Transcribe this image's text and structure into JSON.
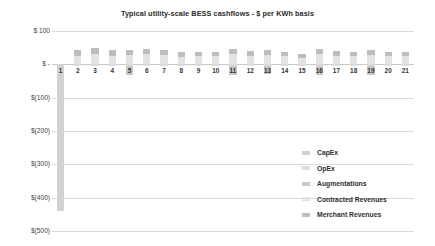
{
  "chart_data": {
    "type": "bar",
    "title": "Typical utility-scale BESS cashflows - $ per KWh basis",
    "xlabel": "",
    "ylabel": "",
    "stacked": true,
    "grid": true,
    "legend_position": "right",
    "ylim": [
      -500,
      100
    ],
    "yticks": [
      100,
      0,
      -100,
      -200,
      -300,
      -400,
      -500
    ],
    "ytick_labels": [
      "$ 100",
      "$ -",
      "$(100)",
      "$(200)",
      "$(300)",
      "$(400)",
      "$(500)"
    ],
    "categories": [
      "1",
      "2",
      "3",
      "4",
      "5",
      "6",
      "7",
      "8",
      "9",
      "10",
      "11",
      "12",
      "13",
      "14",
      "15",
      "16",
      "17",
      "18",
      "19",
      "20",
      "21"
    ],
    "series": [
      {
        "name": "CapEx",
        "color": "#d2d2d2",
        "values": [
          -440,
          0,
          0,
          0,
          0,
          0,
          0,
          0,
          0,
          0,
          0,
          0,
          0,
          0,
          0,
          0,
          0,
          0,
          0,
          0,
          0
        ]
      },
      {
        "name": "OpEx",
        "color": "#dcdcdc",
        "values": [
          0,
          -6,
          -6,
          -6,
          -6,
          -6,
          -6,
          -6,
          -6,
          -6,
          -6,
          -6,
          -6,
          -6,
          -6,
          -6,
          -6,
          -6,
          -6,
          -6,
          -6
        ]
      },
      {
        "name": "Augmentations",
        "color": "#c8c8c8",
        "values": [
          0,
          0,
          0,
          0,
          -26,
          0,
          0,
          0,
          0,
          0,
          -26,
          0,
          -22,
          0,
          0,
          -26,
          0,
          0,
          -26,
          0,
          0
        ]
      },
      {
        "name": "Contracted Revenues",
        "color": "#e3e3e3",
        "values": [
          0,
          26,
          32,
          26,
          28,
          30,
          28,
          22,
          24,
          24,
          30,
          26,
          28,
          24,
          20,
          30,
          26,
          24,
          28,
          24,
          24
        ]
      },
      {
        "name": "Merchant Revenues",
        "color": "#bdbdbd",
        "values": [
          0,
          16,
          18,
          16,
          16,
          16,
          16,
          14,
          14,
          14,
          16,
          14,
          16,
          14,
          12,
          16,
          14,
          14,
          16,
          14,
          14
        ]
      }
    ]
  },
  "legend": {
    "items": [
      {
        "label": "CapEx",
        "color": "#d2d2d2"
      },
      {
        "label": "OpEx",
        "color": "#dcdcdc"
      },
      {
        "label": "Augmentations",
        "color": "#c8c8c8"
      },
      {
        "label": "Contracted Revenues",
        "color": "#e3e3e3"
      },
      {
        "label": "Merchant Revenues",
        "color": "#bdbdbd"
      }
    ]
  }
}
